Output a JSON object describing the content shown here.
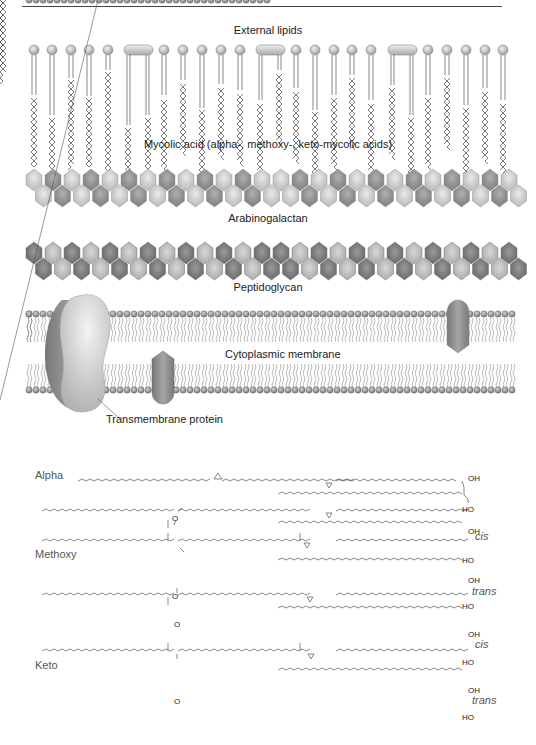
{
  "diagram": {
    "layers": {
      "external_lipids": "External lipids",
      "mycolic_acid": "Mycolic acid (alpha-, methoxy-, keto-mycolic acids)",
      "arabinogalactan": "Arabinogalactan",
      "peptidoglycan": "Peptidoglycan",
      "cytoplasmic_membrane": "Cytoplasmic membrane",
      "transmembrane_protein": "Transmembrane protein"
    },
    "structures": {
      "alpha": "Alpha",
      "methoxy": "Methoxy",
      "keto": "Keto",
      "cis": "cis",
      "trans": "trans",
      "oh": "OH",
      "ho": "HO",
      "o": "O"
    },
    "colors": {
      "light_gray": "#d6d6d6",
      "mid_gray": "#a8a8a8",
      "dark_gray": "#7a7a7a",
      "line": "#555555"
    }
  }
}
